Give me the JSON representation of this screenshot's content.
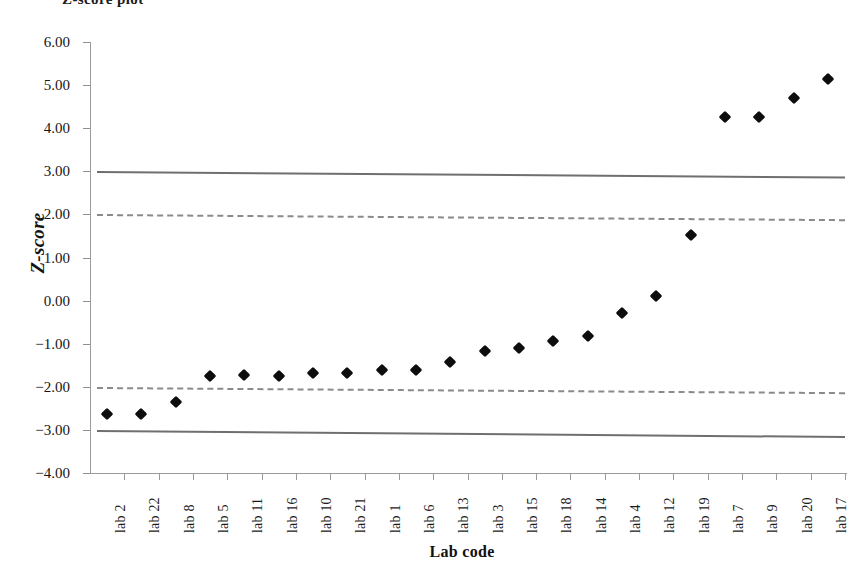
{
  "chart_data": {
    "type": "scatter",
    "title": "",
    "xlabel": "Lab code",
    "ylabel": "Z-score",
    "categories": [
      "lab 2",
      "lab 22",
      "lab 8",
      "lab 5",
      "lab 11",
      "lab 16",
      "lab 10",
      "lab 21",
      "lab 1",
      "lab 6",
      "lab 13",
      "lab 3",
      "lab 15",
      "lab 18",
      "lab 14",
      "lab 4",
      "lab 12",
      "lab 19",
      "lab 7",
      "lab 9",
      "lab 20",
      "lab 17"
    ],
    "values": [
      -2.62,
      -2.62,
      -2.36,
      -1.74,
      -1.73,
      -1.75,
      -1.67,
      -1.68,
      -1.6,
      -1.6,
      -1.43,
      -1.16,
      -1.1,
      -0.93,
      -0.82,
      -0.28,
      0.1,
      1.52,
      4.26,
      4.26,
      4.7,
      5.15
    ],
    "series": [
      {
        "name": "Z-score",
        "marker": "diamond",
        "color": "#0d0d0d",
        "values": [
          -2.62,
          -2.62,
          -2.36,
          -1.74,
          -1.73,
          -1.75,
          -1.67,
          -1.68,
          -1.6,
          -1.6,
          -1.43,
          -1.16,
          -1.1,
          -0.93,
          -0.82,
          -0.28,
          0.1,
          1.52,
          4.26,
          4.26,
          4.7,
          5.15
        ]
      }
    ],
    "reference_lines": [
      {
        "name": "upper-action-limit",
        "style": "solid",
        "color": "#6f6f6f",
        "y_start": 3.0,
        "y_end": 2.87
      },
      {
        "name": "upper-warning-limit",
        "style": "dashed",
        "color": "#8a8a8a",
        "y_start": 2.0,
        "y_end": 1.88
      },
      {
        "name": "lower-warning-limit",
        "style": "dashed",
        "color": "#8a8a8a",
        "y_start": -2.0,
        "y_end": -2.12
      },
      {
        "name": "lower-action-limit",
        "style": "solid",
        "color": "#6f6f6f",
        "y_start": -3.0,
        "y_end": -3.14
      }
    ],
    "ylim": [
      -4.0,
      6.0
    ],
    "yticks": [
      6.0,
      5.0,
      4.0,
      3.0,
      2.0,
      1.0,
      0.0,
      -1.0,
      -2.0,
      -3.0,
      -4.0
    ],
    "ytick_labels": [
      "6.00",
      "5.00",
      "4.00",
      "3.00",
      "2.00",
      "1.00",
      "0.00",
      "−1.00",
      "−2.00",
      "−3.00",
      "−4.00"
    ],
    "grid": false,
    "legend": false
  },
  "axes": {
    "y_title": "Z-score",
    "x_title": "Lab code"
  },
  "title_fragment": "Z-score plot"
}
